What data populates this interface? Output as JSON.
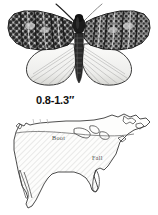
{
  "plate": {
    "specimen": {
      "name": "moth-specimen",
      "description": "moth with spread wings, dark mottled forewings and pale hindwings",
      "body_color": "#1c1c1c",
      "forewing_color": "#3a3a3a",
      "hindwing_color": "#efefec",
      "outline_color": "#2b2b2b"
    },
    "size_label": "0.8-1.3″"
  },
  "map": {
    "name": "us-range-map",
    "outline_color": "#3a3a3a",
    "hatch_color": "#b0b0b0",
    "fill_color": "#fbfbfa",
    "labels": [
      {
        "text": "Boot",
        "x": 52,
        "y": 28
      },
      {
        "text": "Fall",
        "x": 92,
        "y": 48
      }
    ],
    "tick_marks": {
      "count": 3,
      "color": "#b9b9b9"
    }
  }
}
